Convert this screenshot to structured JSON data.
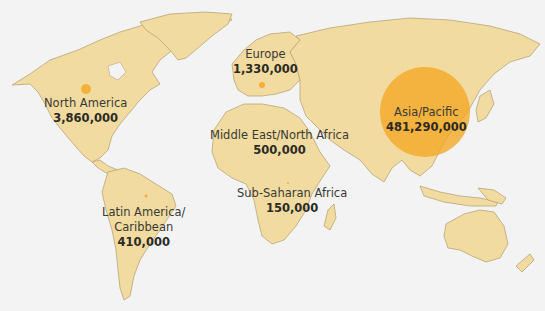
{
  "map": {
    "title": "",
    "colors": {
      "land": "#f1dba0",
      "water": "#f2f3f2",
      "bubble": "#f5a623",
      "text": "#3a3a34"
    },
    "regions": [
      {
        "id": "north-america",
        "name": "North America",
        "value_label": "3,860,000",
        "value": 3860000
      },
      {
        "id": "europe",
        "name": "Europe",
        "value_label": "1,330,000",
        "value": 1330000
      },
      {
        "id": "middle-east-north-africa",
        "name": "Middle East/North Africa",
        "value_label": "500,000",
        "value": 500000
      },
      {
        "id": "asia-pacific",
        "name": "Asia/Pacific",
        "value_label": "481,290,000",
        "value": 481290000
      },
      {
        "id": "latin-america-caribbean",
        "name": "Latin America/\nCaribbean",
        "name_line1": "Latin America/",
        "name_line2": "Caribbean",
        "value_label": "410,000",
        "value": 410000
      },
      {
        "id": "sub-saharan-africa",
        "name": "Sub-Saharan Africa",
        "value_label": "150,000",
        "value": 150000
      }
    ]
  }
}
